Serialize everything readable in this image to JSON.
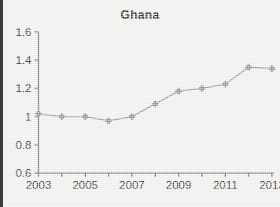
{
  "chart_data": {
    "type": "line",
    "title": "Ghana",
    "xlabel": "",
    "ylabel": "",
    "x": [
      2003,
      2004,
      2005,
      2006,
      2007,
      2008,
      2009,
      2010,
      2011,
      2012,
      2013
    ],
    "values": [
      1.02,
      1.0,
      1.0,
      0.97,
      1.0,
      1.09,
      1.18,
      1.2,
      1.23,
      1.35,
      1.34
    ],
    "series": [
      {
        "name": "Ghana",
        "values": [
          1.02,
          1.0,
          1.0,
          0.97,
          1.0,
          1.09,
          1.18,
          1.2,
          1.23,
          1.35,
          1.34
        ]
      }
    ],
    "ylim": [
      0.6,
      1.6
    ],
    "xlim": [
      2003,
      2013
    ],
    "yticks": [
      0.6,
      0.8,
      1.0,
      1.2,
      1.4,
      1.6
    ],
    "ytick_labels": [
      "0.6",
      "0.8",
      "1",
      "1.2",
      "1.4",
      "1.6"
    ],
    "xticks": [
      2003,
      2004,
      2005,
      2006,
      2007,
      2008,
      2009,
      2010,
      2011,
      2012,
      2013
    ],
    "xtick_labels": [
      "2003",
      "",
      "2005",
      "",
      "2007",
      "",
      "2009",
      "",
      "2011",
      "",
      "2013"
    ],
    "grid": false,
    "legend": false,
    "legend_position": "none",
    "marker": "diamond",
    "colors": {
      "line": "#9a9a9a",
      "marker": "#8f8f8f",
      "axis": "#5a5a5a",
      "text": "#1f1f1f",
      "background": "#f1f1ef",
      "border": "#3b3b3b"
    }
  }
}
